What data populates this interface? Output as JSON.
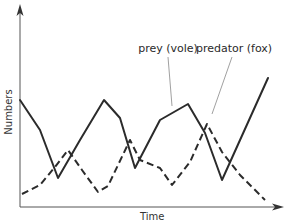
{
  "chart_data": {
    "type": "line",
    "title": "",
    "xlabel": "Time",
    "ylabel": "Numbers",
    "grid": false,
    "legend": "annotations (leader lines)",
    "axis": {
      "x_ticks": [],
      "y_ticks": [],
      "x_arrow": true,
      "y_arrow": true
    },
    "colors": {
      "line": "#2b2b2b",
      "axis": "#555555",
      "leader": "#888888"
    },
    "series": [
      {
        "name": "prey (vole)",
        "style": "solid",
        "points_px": [
          [
            20,
            100
          ],
          [
            40,
            130
          ],
          [
            58,
            178
          ],
          [
            80,
            140
          ],
          [
            104,
            100
          ],
          [
            120,
            118
          ],
          [
            135,
            168
          ],
          [
            160,
            120
          ],
          [
            188,
            104
          ],
          [
            205,
            133
          ],
          [
            222,
            180
          ],
          [
            268,
            78
          ]
        ],
        "relative_values": [
          0.53,
          0.38,
          0.14,
          0.33,
          0.53,
          0.44,
          0.19,
          0.43,
          0.51,
          0.37,
          0.14,
          0.64
        ]
      },
      {
        "name": "predator (fox)",
        "style": "dashed",
        "points_px": [
          [
            22,
            194
          ],
          [
            40,
            185
          ],
          [
            55,
            167
          ],
          [
            68,
            150
          ],
          [
            82,
            170
          ],
          [
            98,
            192
          ],
          [
            108,
            186
          ],
          [
            130,
            140
          ],
          [
            140,
            160
          ],
          [
            160,
            168
          ],
          [
            172,
            185
          ],
          [
            190,
            162
          ],
          [
            207,
            124
          ],
          [
            222,
            152
          ],
          [
            240,
            175
          ],
          [
            265,
            200
          ]
        ],
        "relative_values": [
          0.06,
          0.11,
          0.2,
          0.28,
          0.18,
          0.07,
          0.1,
          0.33,
          0.23,
          0.19,
          0.11,
          0.22,
          0.41,
          0.27,
          0.16,
          0.03
        ]
      }
    ],
    "annotations": [
      {
        "text": "prey (vole)",
        "label_x": 168,
        "label_y": 52,
        "line_from": [
          168,
          57
        ],
        "line_to": [
          172,
          106
        ]
      },
      {
        "text": "predator (fox)",
        "label_x": 234,
        "label_y": 52,
        "line_from": [
          232,
          57
        ],
        "line_to": [
          212,
          114
        ]
      }
    ]
  }
}
